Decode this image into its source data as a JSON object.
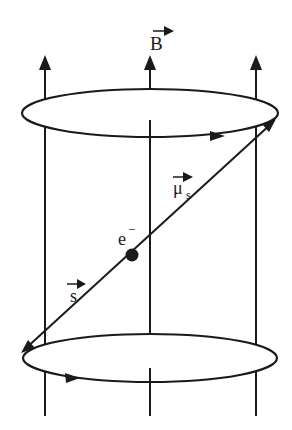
{
  "diagram": {
    "labels": {
      "field": "B",
      "moment": "μ",
      "moment_subscript": "s",
      "spin": "s",
      "electron": "e",
      "electron_charge": "−"
    },
    "colors": {
      "stroke": "#1a1a1a",
      "background": "#ffffff"
    },
    "elements": {
      "field_lines": 3,
      "orbit_ellipses": 2
    }
  }
}
